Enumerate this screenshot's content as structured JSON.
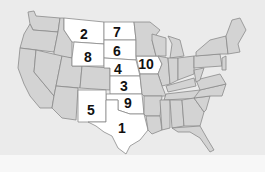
{
  "map": {
    "title": "United States map with numbered highlighted states",
    "colors": {
      "background": "#ebebeb",
      "state_fill": "#d3d3d3",
      "highlight_fill": "#ffffff",
      "border": "#8a8a8a",
      "label": "#111111"
    },
    "labels": [
      {
        "id": "texas",
        "number": "1",
        "x": 122,
        "y": 133
      },
      {
        "id": "montana",
        "number": "2",
        "x": 84,
        "y": 39
      },
      {
        "id": "kansas",
        "number": "3",
        "x": 124,
        "y": 91
      },
      {
        "id": "nebraska",
        "number": "4",
        "x": 118,
        "y": 72
      },
      {
        "id": "new-mexico",
        "number": "5",
        "x": 91,
        "y": 115
      },
      {
        "id": "south-dakota",
        "number": "6",
        "x": 117,
        "y": 56
      },
      {
        "id": "north-dakota",
        "number": "7",
        "x": 117,
        "y": 38
      },
      {
        "id": "wyoming",
        "number": "8",
        "x": 88,
        "y": 63
      },
      {
        "id": "oklahoma",
        "number": "9",
        "x": 128,
        "y": 108
      },
      {
        "id": "iowa",
        "number": "10",
        "x": 145,
        "y": 68
      }
    ]
  }
}
